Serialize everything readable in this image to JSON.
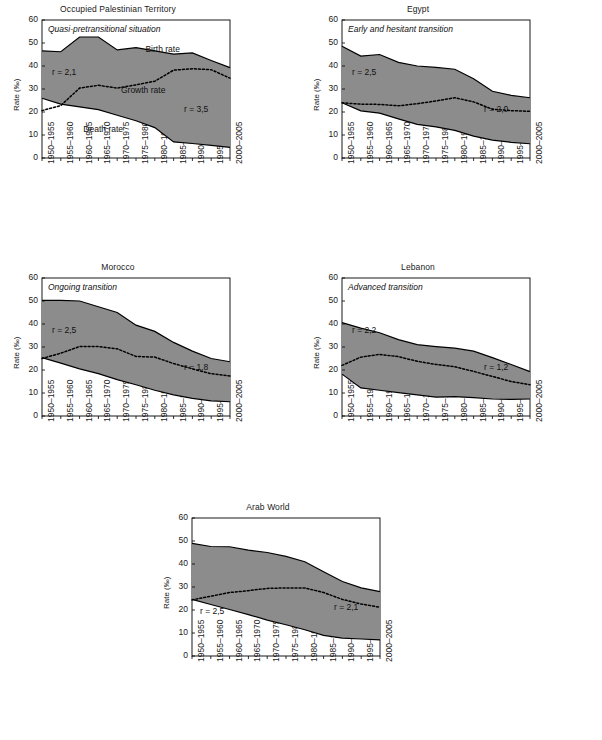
{
  "figure": {
    "panel_count": 5,
    "periods": [
      "1950–1955",
      "1955–1960",
      "1960–1965",
      "1965–1970",
      "1970–1975",
      "1975–1980",
      "1980–1985",
      "1985–1990",
      "1990–1995",
      "1995–2000",
      "2000–2005"
    ],
    "y_axis_label": "Rate (‰)",
    "y_ticks": [
      "0",
      "10",
      "20",
      "30",
      "40",
      "50",
      "60"
    ],
    "fill_color": "#8c8c8c",
    "line_color": "#000000",
    "series_names": {
      "birth": "Birth rate",
      "death": "Death rate",
      "growth": "Growth rate"
    }
  },
  "chart_data": [
    {
      "type": "area",
      "title": "Occupied Palestinian Territory",
      "subtitle": "Quasi-pretransitional situation",
      "xlabel": "",
      "ylabel": "Rate (‰)",
      "ylim": [
        0,
        60
      ],
      "grid": false,
      "legend": "inline-annotations",
      "categories": [
        "1950–1955",
        "1955–1960",
        "1960–1965",
        "1965–1970",
        "1970–1975",
        "1975–1980",
        "1980–1985",
        "1985–1990",
        "1990–1995",
        "1995–2000",
        "2000–2005"
      ],
      "series": [
        {
          "name": "Birth rate",
          "values": [
            46.6,
            46.2,
            52.6,
            52.6,
            47.0,
            48.0,
            46.6,
            45.2,
            45.7,
            42.4,
            39.3
          ]
        },
        {
          "name": "Death rate",
          "values": [
            26.0,
            23.4,
            22.2,
            21.0,
            18.6,
            16.2,
            13.2,
            7.0,
            6.3,
            5.5,
            4.6
          ]
        },
        {
          "name": "Growth rate",
          "values": [
            20.6,
            22.8,
            30.4,
            31.6,
            30.4,
            31.8,
            33.4,
            38.2,
            38.8,
            38.4,
            34.7
          ]
        }
      ],
      "annotations": [
        {
          "text": "r = 2,1",
          "position": "upper-left",
          "value": 2.1
        },
        {
          "text": "r = 3,5",
          "position": "lower-right",
          "value": 3.5
        },
        {
          "text": "Birth rate",
          "position": "upper-middle"
        },
        {
          "text": "Growth rate",
          "position": "middle"
        },
        {
          "text": "Death rate",
          "position": "lower-left"
        }
      ]
    },
    {
      "type": "area",
      "title": "Egypt",
      "subtitle": "Early and hesitant transition",
      "xlabel": "",
      "ylabel": "Rate (‰)",
      "ylim": [
        0,
        60
      ],
      "grid": false,
      "legend": "inline-annotations",
      "categories": [
        "1950–1955",
        "1955–1960",
        "1960–1965",
        "1965–1970",
        "1970–1975",
        "1975–1980",
        "1980–1985",
        "1985–1990",
        "1990–1995",
        "1995–2000",
        "2000–2005"
      ],
      "series": [
        {
          "name": "Birth rate",
          "values": [
            48.6,
            44.3,
            45.0,
            41.6,
            40.0,
            39.4,
            38.6,
            34.5,
            29.0,
            27.2,
            26.2
          ]
        },
        {
          "name": "Death rate",
          "values": [
            24.0,
            20.5,
            19.5,
            17.0,
            14.6,
            13.5,
            12.0,
            9.5,
            7.8,
            6.8,
            6.2
          ]
        },
        {
          "name": "Growth rate",
          "values": [
            24.0,
            23.4,
            23.3,
            22.7,
            23.6,
            24.8,
            26.2,
            24.4,
            21.2,
            20.6,
            20.3
          ]
        }
      ],
      "annotations": [
        {
          "text": "r = 2,5",
          "position": "upper-left",
          "value": 2.5
        },
        {
          "text": "r = 2,0",
          "position": "lower-right",
          "value": 2.0
        }
      ]
    },
    {
      "type": "area",
      "title": "Morocco",
      "subtitle": "Ongoing transition",
      "xlabel": "",
      "ylabel": "Rate (‰)",
      "ylim": [
        0,
        60
      ],
      "grid": false,
      "legend": "inline-annotations",
      "categories": [
        "1950–1955",
        "1955–1960",
        "1960–1965",
        "1965–1970",
        "1970–1975",
        "1975–1980",
        "1980–1985",
        "1985–1990",
        "1990–1995",
        "1995–2000",
        "2000–2005"
      ],
      "series": [
        {
          "name": "Birth rate",
          "values": [
            50.3,
            50.3,
            50.0,
            47.5,
            45.0,
            39.5,
            36.8,
            32.0,
            28.2,
            25.0,
            23.6
          ]
        },
        {
          "name": "Death rate",
          "values": [
            25.4,
            23.0,
            20.5,
            18.4,
            15.8,
            13.6,
            11.2,
            9.2,
            7.7,
            6.6,
            6.2
          ]
        },
        {
          "name": "Growth rate",
          "values": [
            25.0,
            27.3,
            30.2,
            30.2,
            29.2,
            25.9,
            25.6,
            22.8,
            20.5,
            18.4,
            17.4
          ]
        }
      ],
      "annotations": [
        {
          "text": "r = 2,5",
          "position": "upper-left",
          "value": 2.5
        },
        {
          "text": "r = 1,8",
          "position": "lower-right",
          "value": 1.8
        }
      ]
    },
    {
      "type": "area",
      "title": "Lebanon",
      "subtitle": "Advanced transition",
      "xlabel": "",
      "ylabel": "Rate (‰)",
      "ylim": [
        0,
        60
      ],
      "grid": false,
      "legend": "inline-annotations",
      "categories": [
        "1950–1955",
        "1955–1960",
        "1960–1965",
        "1965–1970",
        "1970–1975",
        "1975–1980",
        "1980–1985",
        "1985–1990",
        "1990–1995",
        "1995–2000",
        "2000–2005"
      ],
      "series": [
        {
          "name": "Birth rate",
          "values": [
            40.6,
            38.2,
            36.2,
            33.2,
            31.0,
            30.2,
            29.5,
            28.2,
            25.4,
            22.4,
            19.3
          ]
        },
        {
          "name": "Death rate",
          "values": [
            18.2,
            12.2,
            11.2,
            10.2,
            9.2,
            8.2,
            8.4,
            8.0,
            7.4,
            7.2,
            7.4
          ]
        },
        {
          "name": "Growth rate",
          "values": [
            22.0,
            25.6,
            26.8,
            25.8,
            23.8,
            22.4,
            21.4,
            19.4,
            17.2,
            15.0,
            13.6
          ]
        }
      ],
      "annotations": [
        {
          "text": "r = 2,2",
          "position": "upper-left",
          "value": 2.2
        },
        {
          "text": "r = 1,2",
          "position": "lower-right",
          "value": 1.2
        }
      ]
    },
    {
      "type": "area",
      "title": "Arab World",
      "subtitle": "",
      "xlabel": "",
      "ylabel": "Rate (‰)",
      "ylim": [
        0,
        60
      ],
      "grid": false,
      "legend": "inline-annotations",
      "categories": [
        "1950–1955",
        "1955–1960",
        "1960–1965",
        "1965–1970",
        "1970–1975",
        "1975–1980",
        "1980–1985",
        "1985–1990",
        "1990–1995",
        "1995–2000",
        "2000–2005"
      ],
      "series": [
        {
          "name": "Birth rate",
          "values": [
            49.0,
            47.6,
            47.5,
            46.0,
            45.0,
            43.3,
            41.0,
            36.6,
            32.4,
            29.6,
            28.0
          ]
        },
        {
          "name": "Death rate",
          "values": [
            24.6,
            22.4,
            20.2,
            18.0,
            15.6,
            13.6,
            11.4,
            9.0,
            7.8,
            7.4,
            7.0
          ]
        },
        {
          "name": "Growth rate",
          "values": [
            24.4,
            26.0,
            27.6,
            28.4,
            29.4,
            29.6,
            29.6,
            27.6,
            24.6,
            22.6,
            21.2
          ]
        }
      ],
      "annotations": [
        {
          "text": "r = 2,5",
          "position": "lower-left",
          "value": 2.5
        },
        {
          "text": "r = 2,1",
          "position": "lower-right",
          "value": 2.1
        }
      ]
    }
  ]
}
